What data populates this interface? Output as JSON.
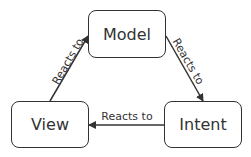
{
  "diagram": {
    "nodes": {
      "model": {
        "label": "Model"
      },
      "view": {
        "label": "View"
      },
      "intent": {
        "label": "Intent"
      }
    },
    "edges": [
      {
        "from": "View",
        "to": "Model",
        "label": "Reacts to"
      },
      {
        "from": "Model",
        "to": "Intent",
        "label": "Reacts to"
      },
      {
        "from": "Intent",
        "to": "View",
        "label": "Reacts to"
      }
    ],
    "colors": {
      "stroke": "#333333",
      "text": "#333333",
      "background": "#ffffff"
    }
  }
}
